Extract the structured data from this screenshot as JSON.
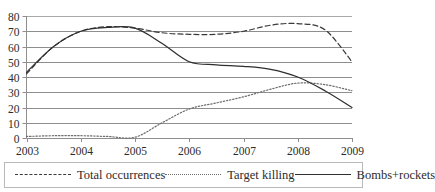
{
  "chart_data": {
    "type": "line",
    "title": "",
    "xlabel": "",
    "ylabel": "",
    "grid": true,
    "legend_position": "bottom",
    "xlim": [
      2003,
      2009
    ],
    "ylim": [
      0,
      80
    ],
    "x_tick_labels": [
      "2003",
      "2004",
      "2005",
      "2006",
      "2007",
      "2008",
      "2009"
    ],
    "y_tick_labels": [
      "0",
      "10",
      "20",
      "30",
      "40",
      "50",
      "60",
      "70",
      "80"
    ],
    "y_ticks": [
      0,
      10,
      20,
      30,
      40,
      50,
      60,
      70,
      80
    ],
    "x": [
      2003,
      2003.5,
      2004,
      2004.5,
      2005,
      2005.5,
      2006,
      2006.5,
      2007,
      2007.5,
      2008,
      2008.5,
      2009
    ],
    "series": [
      {
        "name": "Total occurrences",
        "style": "dashed",
        "color": "#3a3a3a",
        "values": [
          42,
          60,
          70,
          73,
          72,
          69,
          68,
          68,
          70,
          74,
          75,
          71,
          50
        ]
      },
      {
        "name": "Target killing",
        "style": "dotted",
        "color": "#6d6d6d",
        "values": [
          1,
          1.5,
          1.5,
          1,
          0.5,
          10,
          19,
          23,
          27,
          32,
          36,
          35,
          31
        ]
      },
      {
        "name": "Bombs+rockets",
        "style": "solid",
        "color": "#2f2f2f",
        "values": [
          43,
          60,
          70,
          72.5,
          72,
          62,
          50,
          48,
          47,
          45,
          40,
          31,
          20
        ]
      }
    ]
  },
  "legend": {
    "items": [
      {
        "label": "Total occurrences",
        "style": "dashed",
        "swatch": "legend-swatch-dashed"
      },
      {
        "label": "Target killing",
        "style": "dotted",
        "swatch": "legend-swatch-dotted"
      },
      {
        "label": "Bombs+rockets",
        "style": "solid",
        "swatch": "legend-swatch-solid"
      }
    ]
  }
}
